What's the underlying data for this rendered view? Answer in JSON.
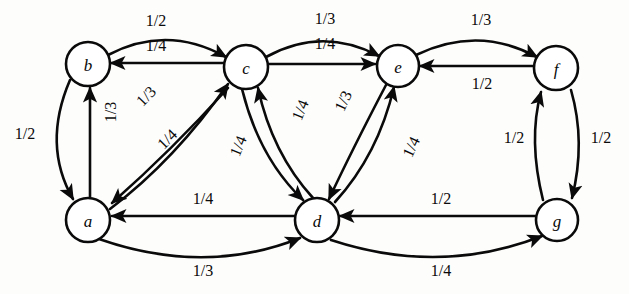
{
  "diagram": {
    "type": "directed-weighted-graph",
    "title": "",
    "canvas": {
      "width": 629,
      "height": 294
    },
    "background_color": "#fdfdfc",
    "stroke_color": "#0a0a0a",
    "nodes": [
      {
        "id": "b",
        "label": "b",
        "cx": 88,
        "cy": 64,
        "r": 22
      },
      {
        "id": "c",
        "label": "c",
        "cx": 246,
        "cy": 67,
        "r": 22
      },
      {
        "id": "e",
        "label": "e",
        "cx": 398,
        "cy": 66,
        "r": 21
      },
      {
        "id": "f",
        "label": "f",
        "cx": 556,
        "cy": 68,
        "r": 22
      },
      {
        "id": "a",
        "label": "a",
        "cx": 88,
        "cy": 220,
        "r": 22
      },
      {
        "id": "d",
        "label": "d",
        "cx": 317,
        "cy": 220,
        "r": 22
      },
      {
        "id": "g",
        "label": "g",
        "cx": 557,
        "cy": 220,
        "r": 21
      }
    ],
    "edges": [
      {
        "from": "b",
        "to": "c",
        "weight": "1/2",
        "path": "M 108 55 Q 167 24 226 57",
        "label_x": 156,
        "label_y": 20,
        "rotate": 0
      },
      {
        "from": "c",
        "to": "b",
        "weight": "1/4",
        "path": "M 224 63 L 111 63",
        "label_x": 156,
        "label_y": 45,
        "rotate": 0
      },
      {
        "from": "c",
        "to": "e",
        "weight": "1/3",
        "path": "M 266 57 Q 322 26 379 56",
        "label_x": 325,
        "label_y": 18,
        "rotate": 0
      },
      {
        "from": "e",
        "to": "c",
        "weight": "1/4",
        "path": "M 268 64 L 375 64",
        "label_x": 325,
        "label_y": 43,
        "rotate": 0
      },
      {
        "from": "e",
        "to": "f",
        "weight": "1/3",
        "path": "M 416 55 Q 478 25 537 57",
        "label_x": 481,
        "label_y": 19,
        "rotate": 0
      },
      {
        "from": "f",
        "to": "e",
        "weight": "1/2",
        "path": "M 534 66 L 420 66",
        "label_x": 482,
        "label_y": 83,
        "rotate": 0
      },
      {
        "from": "b",
        "to": "a",
        "weight": "1/2",
        "path": "M 70 80 Q 42 145 73 199",
        "label_x": 25,
        "label_y": 133,
        "rotate": 0
      },
      {
        "from": "a",
        "to": "b",
        "weight": "1/3",
        "path": "M 90 197 L 90 88",
        "label_x": 110,
        "label_y": 112,
        "rotate": -90
      },
      {
        "from": "a",
        "to": "c",
        "weight": "1/3",
        "path": "M 110 209 Q 175 160 228 84",
        "label_x": 146,
        "label_y": 96,
        "rotate": -46
      },
      {
        "from": "c",
        "to": "a",
        "weight": "1/4",
        "path": "M 228 88 Q 172 150 112 203",
        "label_x": 167,
        "label_y": 139,
        "rotate": -45
      },
      {
        "from": "c",
        "to": "d",
        "weight": "1/4",
        "path": "M 242 89 Q 259 158 303 200",
        "label_x": 238,
        "label_y": 146,
        "rotate": -68
      },
      {
        "from": "d",
        "to": "c",
        "weight": "1/4",
        "path": "M 313 198 Q 272 153 258 88",
        "label_x": 300,
        "label_y": 110,
        "rotate": -68
      },
      {
        "from": "e",
        "to": "d",
        "weight": "1/3",
        "path": "M 386 85 Q 352 150 329 199",
        "label_x": 343,
        "label_y": 101,
        "rotate": -65
      },
      {
        "from": "d",
        "to": "e",
        "weight": "1/4",
        "path": "M 335 202 Q 378 155 394 87",
        "label_x": 411,
        "label_y": 147,
        "rotate": -65
      },
      {
        "from": "d",
        "to": "a",
        "weight": "1/4",
        "path": "M 295 216 L 112 216",
        "label_x": 203,
        "label_y": 198,
        "rotate": 0
      },
      {
        "from": "a",
        "to": "d",
        "weight": "1/3",
        "path": "M 99 239 Q 205 276 300 238",
        "label_x": 203,
        "label_y": 270,
        "rotate": 0
      },
      {
        "from": "g",
        "to": "d",
        "weight": "1/2",
        "path": "M 535 216 L 340 216",
        "label_x": 441,
        "label_y": 198,
        "rotate": 0
      },
      {
        "from": "d",
        "to": "g",
        "weight": "1/4",
        "path": "M 331 240 Q 440 276 542 236",
        "label_x": 441,
        "label_y": 270,
        "rotate": 0
      },
      {
        "from": "g",
        "to": "f",
        "weight": "1/2",
        "path": "M 543 200 Q 528 140 541 92",
        "label_x": 514,
        "label_y": 137,
        "rotate": 0
      },
      {
        "from": "f",
        "to": "g",
        "weight": "1/2",
        "path": "M 571 90 Q 586 142 572 198",
        "label_x": 601,
        "label_y": 137,
        "rotate": 0
      }
    ]
  }
}
